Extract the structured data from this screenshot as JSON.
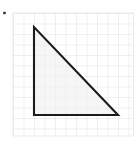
{
  "figure": {
    "canvas": {
      "width": 140,
      "height": 142,
      "background": "#ffffff"
    },
    "bullet_marker": {
      "name": "list-bullet",
      "x": 4.5,
      "y": 13.0,
      "size": 2.4,
      "color": "#2b2b2b"
    },
    "grid": {
      "x0": 13,
      "y0": 13,
      "x1": 133.5,
      "y1": 136,
      "cell": 10.5,
      "columns": 11,
      "rows": 11,
      "line_color": "#d4d4d4",
      "line_width": 0.7,
      "border_color": "#e2e2e2",
      "border_width": 0.7
    },
    "shape": {
      "name": "right-triangle",
      "type": "polygon",
      "stroke_color": "#1c1c1c",
      "stroke_width": 2.1,
      "fill_color": "#f0f0f0",
      "fill_opacity": 0.62,
      "legs_in_cells": {
        "vertical": 8,
        "horizontal": 8
      },
      "right_angle_at": "bottom-left",
      "vertices_px": [
        {
          "label": "apex",
          "x": 34,
          "y": 27
        },
        {
          "label": "right-angle",
          "x": 34,
          "y": 115
        },
        {
          "label": "bottom-right",
          "x": 118,
          "y": 115
        }
      ],
      "points_attr": "34,27 34,115 118,115"
    }
  },
  "chart_data": {
    "type": "scatter",
    "xlabel": "",
    "ylabel": "",
    "xlim": [
      0,
      11
    ],
    "ylim": [
      0,
      11
    ],
    "grid": true,
    "legend_position": "none",
    "annotations": [
      "Right angle at bottom-left vertex",
      "Vertical leg spans 8 grid units",
      "Horizontal leg spans 8 grid units",
      "Hypotenuse runs from top-left apex to bottom-right vertex"
    ],
    "series": [
      {
        "name": "triangle",
        "x": [
          2,
          2,
          10,
          2
        ],
        "y": [
          10,
          1.6,
          1.6,
          10
        ]
      }
    ]
  }
}
